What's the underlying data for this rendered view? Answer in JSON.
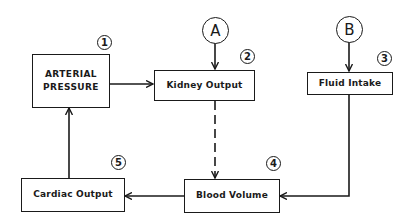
{
  "diagram": {
    "nodes": [
      {
        "id": 1,
        "label_line1": "ARTERIAL",
        "label_line2": "PRESSURE",
        "number": "1"
      },
      {
        "id": 2,
        "label": "Kidney Output",
        "number": "2"
      },
      {
        "id": 3,
        "label": "Fluid Intake",
        "number": "3"
      },
      {
        "id": 4,
        "label": "Blood Volume",
        "number": "4"
      },
      {
        "id": 5,
        "label": "Cardiac Output",
        "number": "5"
      }
    ],
    "inputs": [
      {
        "label": "A",
        "target": "Kidney Output"
      },
      {
        "label": "B",
        "target": "Fluid Intake"
      }
    ],
    "edges": [
      {
        "from": "Arterial Pressure",
        "to": "Kidney Output",
        "style": "solid"
      },
      {
        "from": "A",
        "to": "Kidney Output",
        "style": "solid"
      },
      {
        "from": "B",
        "to": "Fluid Intake",
        "style": "solid"
      },
      {
        "from": "Kidney Output",
        "to": "Blood Volume",
        "style": "dashed"
      },
      {
        "from": "Fluid Intake",
        "to": "Blood Volume",
        "style": "solid"
      },
      {
        "from": "Blood Volume",
        "to": "Cardiac Output",
        "style": "solid"
      },
      {
        "from": "Cardiac Output",
        "to": "Arterial Pressure",
        "style": "solid"
      }
    ],
    "line_color": "#1a1a1a"
  }
}
